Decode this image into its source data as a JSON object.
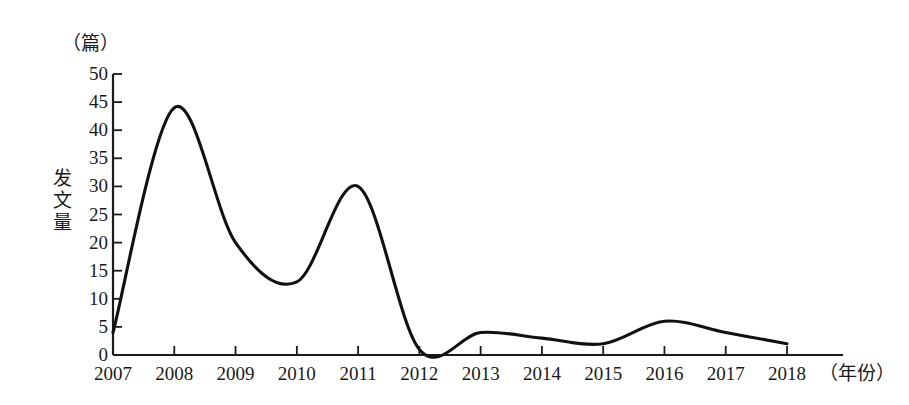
{
  "chart_data": {
    "type": "line",
    "title": "",
    "xlabel": "年份",
    "ylabel": "发文量",
    "yunit": "篇",
    "xunit": "年份",
    "x": [
      2007,
      2008,
      2009,
      2010,
      2011,
      2012,
      2013,
      2014,
      2015,
      2016,
      2017,
      2018
    ],
    "values": [
      4,
      44,
      20,
      13,
      30,
      1,
      4,
      3,
      2,
      6,
      4,
      2
    ],
    "categories": [
      "2007",
      "2008",
      "2009",
      "2010",
      "2011",
      "2012",
      "2013",
      "2014",
      "2015",
      "2016",
      "2017",
      "2018"
    ],
    "ylim": [
      0,
      50
    ],
    "yticks": [
      0,
      5,
      10,
      15,
      20,
      25,
      30,
      35,
      40,
      45,
      50
    ],
    "ytick_labels": [
      "0",
      "5",
      "10",
      "15",
      "20",
      "25",
      "30",
      "35",
      "40",
      "45",
      "50"
    ],
    "xtick_labels": [
      "2007",
      "2008",
      "2009",
      "2010",
      "2011",
      "2012",
      "2013",
      "2014",
      "2015",
      "2016",
      "2017",
      "2018"
    ],
    "grid": false,
    "legend": "none",
    "line_color": "#111111",
    "axis_color": "#1a1a1a",
    "series": [
      {
        "name": "发文量",
        "values": [
          4,
          44,
          20,
          13,
          30,
          1,
          4,
          3,
          2,
          6,
          4,
          2
        ]
      }
    ]
  },
  "axes": {
    "y_unit_label": "（篇）",
    "y_axis_title": "发文量",
    "x_unit_label": "（年份）"
  }
}
